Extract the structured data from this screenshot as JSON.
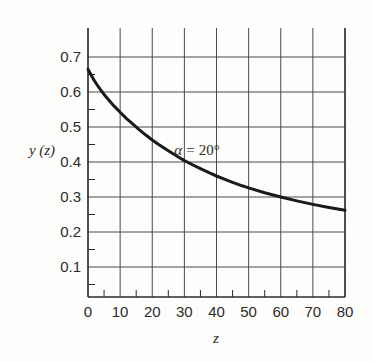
{
  "chart_data": {
    "type": "line",
    "title": "",
    "subtitle": "",
    "xlabel": "z",
    "ylabel": "y (z)",
    "xlim": [
      0,
      80
    ],
    "ylim": [
      0,
      0.75
    ],
    "grid": true,
    "legend_position": "none",
    "x_major_ticks": [
      0,
      10,
      20,
      30,
      40,
      50,
      60,
      70,
      80
    ],
    "x_tick_labels": [
      "0",
      "10",
      "20",
      "30",
      "40",
      "50",
      "60",
      "70",
      "80"
    ],
    "x_minor_interval": 5,
    "y_major_ticks": [
      0.1,
      0.2,
      0.3,
      0.4,
      0.5,
      0.6,
      0.7
    ],
    "y_tick_labels": [
      "0.1",
      "0.2",
      "0.3",
      "0.4",
      "0.5",
      "0.6",
      "0.7"
    ],
    "y_minor_interval": 0.05,
    "annotations": [
      {
        "name": "alpha-annotation",
        "symbol": "α",
        "equals": "=",
        "value": "20°",
        "text": "α = 20°",
        "x": 38,
        "y": 0.44
      }
    ],
    "series": [
      {
        "name": "y(z)",
        "color": "#1a1a1a",
        "line_width": 3,
        "x": [
          0,
          1,
          2,
          3,
          4,
          5,
          6,
          8,
          10,
          12,
          14,
          16,
          18,
          20,
          22,
          25,
          28,
          30,
          33,
          35,
          38,
          40,
          43,
          45,
          48,
          50,
          55,
          60,
          65,
          70,
          75,
          80
        ],
        "values": [
          0.665,
          0.648,
          0.632,
          0.618,
          0.605,
          0.593,
          0.582,
          0.561,
          0.542,
          0.524,
          0.508,
          0.492,
          0.477,
          0.463,
          0.45,
          0.432,
          0.415,
          0.404,
          0.39,
          0.381,
          0.368,
          0.36,
          0.349,
          0.342,
          0.332,
          0.326,
          0.312,
          0.3,
          0.289,
          0.279,
          0.27,
          0.262
        ]
      }
    ],
    "curve_points": [
      {
        "z": 0,
        "y": 0.665
      },
      {
        "z": 5,
        "y": 0.6
      },
      {
        "z": 12,
        "y": 0.5
      },
      {
        "z": 21,
        "y": 0.4
      },
      {
        "z": 35,
        "y": 0.3
      },
      {
        "z": 55,
        "y": 0.2
      },
      {
        "z": 80,
        "y": 0.157
      }
    ]
  },
  "colors": {
    "curve": "#1a1a1a",
    "grid": "#4a4a4a",
    "axis": "#2b2b2b",
    "background": "#fdfdfc",
    "text": "#2b2b2b"
  }
}
